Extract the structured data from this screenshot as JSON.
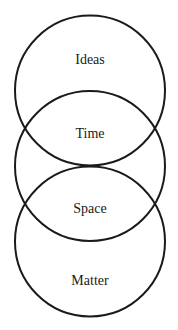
{
  "diagram": {
    "type": "stacked-overlapping-circles",
    "stroke_color": "#1a1a1a",
    "background": "#ffffff",
    "circles": [
      {
        "id": "top",
        "cx": 90,
        "cy": 90.5,
        "r": 75
      },
      {
        "id": "middle",
        "cx": 90,
        "cy": 166,
        "r": 75
      },
      {
        "id": "bottom",
        "cx": 90,
        "cy": 241.5,
        "r": 75
      }
    ],
    "labels": [
      {
        "text": "Ideas",
        "y": 60
      },
      {
        "text": "Time",
        "y": 134
      },
      {
        "text": "Space",
        "y": 209
      },
      {
        "text": "Matter",
        "y": 281
      }
    ]
  }
}
